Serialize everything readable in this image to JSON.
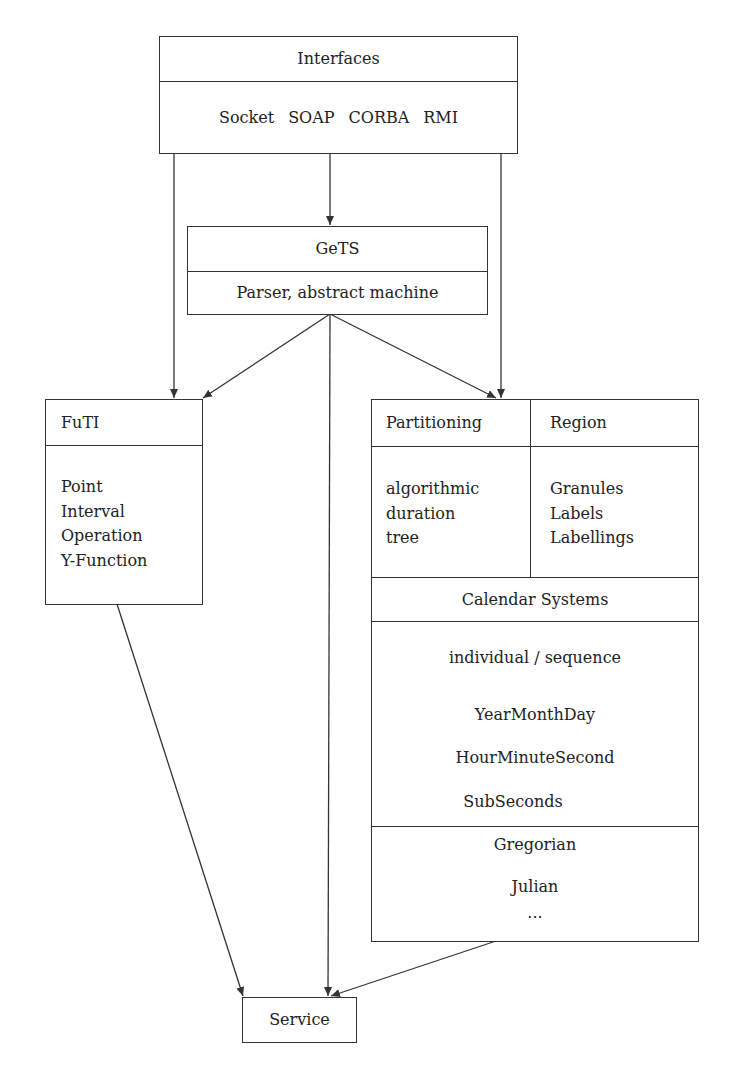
{
  "interfaces": {
    "title": "Interfaces",
    "items": [
      "Socket",
      "SOAP",
      "CORBA",
      "RMI"
    ]
  },
  "gets": {
    "title": "GeTS",
    "subtitle": "Parser, abstract machine"
  },
  "futi": {
    "title": "FuTI",
    "items": [
      "Point",
      "Interval",
      "Operation",
      "Y-Function"
    ]
  },
  "calendar_module": {
    "partitioning": {
      "title": "Partitioning",
      "items": [
        "algorithmic",
        "duration",
        "tree"
      ]
    },
    "region": {
      "title": "Region",
      "items": [
        "Granules",
        "Labels",
        "Labellings"
      ]
    },
    "calendar_systems": {
      "title": "Calendar Systems",
      "kinds": "individual / sequence",
      "items": [
        "YearMonthDay",
        "HourMinuteSecond",
        "SubSeconds"
      ]
    },
    "calendars": {
      "items": [
        "Gregorian",
        "Julian",
        "..."
      ]
    }
  },
  "service": {
    "title": "Service"
  },
  "edges": [
    {
      "from": "Interfaces",
      "to": "GeTS"
    },
    {
      "from": "Interfaces",
      "to": "FuTI"
    },
    {
      "from": "Interfaces",
      "to": "Partitioning/Region module"
    },
    {
      "from": "GeTS",
      "to": "FuTI"
    },
    {
      "from": "GeTS",
      "to": "Partitioning/Region module"
    },
    {
      "from": "GeTS",
      "to": "Service"
    },
    {
      "from": "FuTI",
      "to": "Service"
    },
    {
      "from": "Partitioning/Region module",
      "to": "Service"
    }
  ],
  "colors": {
    "line": "#333333",
    "text": "#222222",
    "background": "#ffffff"
  }
}
